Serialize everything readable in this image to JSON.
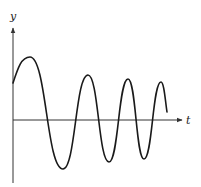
{
  "chart_data": {
    "type": "line",
    "title": "",
    "xlabel": "t",
    "ylabel": "y",
    "grid": false,
    "legend": null,
    "series": [
      {
        "name": "y(t)",
        "points_px": [
          [
            13,
            83
          ],
          [
            30,
            57
          ],
          [
            63,
            169
          ],
          [
            88,
            75
          ],
          [
            109,
            162
          ],
          [
            128,
            79
          ],
          [
            144,
            159
          ],
          [
            161,
            82
          ],
          [
            167,
            112
          ]
        ],
        "extrema": {
          "peaks_px": [
            [
              30,
              57
            ],
            [
              88,
              75
            ],
            [
              128,
              79
            ],
            [
              161,
              82
            ]
          ],
          "troughs_px": [
            [
              63,
              169
            ],
            [
              109,
              162
            ],
            [
              144,
              159
            ]
          ]
        }
      }
    ],
    "axes": {
      "origin_px": [
        13,
        120
      ],
      "y_axis_top_px": 27,
      "y_axis_bottom_px": 183,
      "x_axis_right_px": 182
    },
    "colors": {
      "curve": "#1a1a1a",
      "axes": "#333333",
      "background": "#ffffff"
    }
  },
  "labels": {
    "x_axis": "t",
    "y_axis": "y"
  }
}
